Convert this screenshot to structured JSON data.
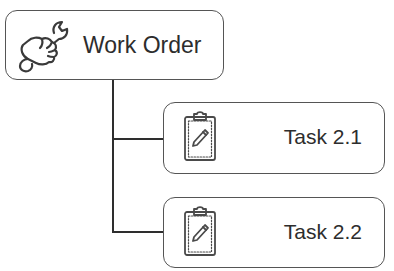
{
  "diagram": {
    "type": "hierarchy",
    "root": {
      "label": "Work Order",
      "icon": "wrench-hand-icon"
    },
    "children": [
      {
        "label": "Task 2.1",
        "icon": "clipboard-pencil-icon"
      },
      {
        "label": "Task 2.2",
        "icon": "clipboard-pencil-icon"
      }
    ],
    "colors": {
      "border": "#555555",
      "connector": "#2e2e2e",
      "text": "#2d2d2d",
      "background": "#ffffff"
    }
  }
}
